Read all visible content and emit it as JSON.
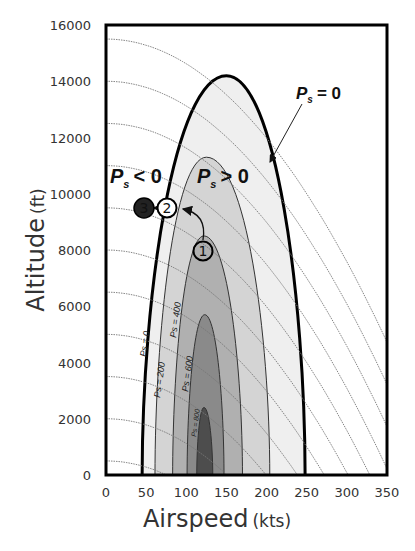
{
  "chart_data": {
    "type": "area",
    "title": "",
    "xlabel": "Airspeed",
    "xlabel_unit": "(kts)",
    "ylabel": "Altitude",
    "ylabel_unit": "(ft)",
    "xlim": [
      0,
      350
    ],
    "ylim": [
      0,
      16000
    ],
    "x_ticks": [
      "0",
      "50",
      "100",
      "150",
      "200",
      "250",
      "300",
      "350"
    ],
    "y_ticks": [
      "0",
      "2000",
      "4000",
      "6000",
      "8000",
      "10000",
      "12000",
      "14000",
      "16000"
    ],
    "grid": false,
    "series": [
      {
        "name": "Ps = 0",
        "label": "Ps = 0",
        "fill": "#efefef",
        "stroke": "#000000",
        "base_x": [
          45,
          248
        ],
        "peak": {
          "x": 150,
          "y": 14200
        }
      },
      {
        "name": "Ps = 200",
        "label": "Ps = 200",
        "fill": "#d4d4d4",
        "stroke": "#333333",
        "base_x": [
          61,
          204
        ],
        "peak": {
          "x": 125,
          "y": 11300
        }
      },
      {
        "name": "Ps = 400",
        "label": "Ps = 400",
        "fill": "#b0b0b0",
        "stroke": "#333333",
        "base_x": [
          83,
          170
        ],
        "peak": {
          "x": 122,
          "y": 8500
        }
      },
      {
        "name": "Ps = 600",
        "label": "Ps = 600",
        "fill": "#8a8a8a",
        "stroke": "#333333",
        "base_x": [
          101,
          147
        ],
        "peak": {
          "x": 123,
          "y": 5700
        }
      },
      {
        "name": "Ps = 800",
        "label": "Ps = 800",
        "fill": "#4d4d4d",
        "stroke": "#333333",
        "base_x": [
          113,
          133
        ],
        "peak": {
          "x": 122,
          "y": 2400
        }
      }
    ],
    "energy_height_curves": {
      "style": "dotted",
      "left_edge_altitudes": [
        15500,
        14000,
        12500,
        11000,
        9500,
        8000,
        6500,
        5000,
        3500,
        2000,
        500
      ]
    },
    "annotations": [
      {
        "text": "Ps = 0",
        "x": 225,
        "y": 15600,
        "arrow_to": {
          "x": 207,
          "y": 12000
        }
      },
      {
        "text": "Ps < 0",
        "x": 15,
        "y": 10400
      },
      {
        "text": "Ps > 0",
        "x": 100,
        "y": 10400
      }
    ],
    "points": [
      {
        "label": "1",
        "x": 122,
        "y": 7900,
        "style": "open-circle"
      },
      {
        "label": "2",
        "x": 77,
        "y": 9500,
        "style": "open-circle"
      },
      {
        "label": "3",
        "x": 50,
        "y": 9500,
        "style": "filled-circle"
      }
    ],
    "arrows": [
      {
        "from": "1",
        "to": "2",
        "style": "curved"
      },
      {
        "from": "2",
        "to": "3",
        "style": "straight"
      }
    ]
  },
  "text": {
    "ps_eq_zero_main": "= 0",
    "ps_lt_zero": "< 0",
    "ps_gt_zero": "> 0",
    "P": "P",
    "s": "s",
    "x_title": "Airspeed",
    "x_unit": "(kts)",
    "y_title": "Altitude",
    "y_unit": "(ft)",
    "contour_labels": [
      "Ps = 0",
      "Ps = 200",
      "Ps = 400",
      "Ps = 600",
      "Ps = 800"
    ],
    "markers": [
      "1",
      "2",
      "3"
    ]
  }
}
